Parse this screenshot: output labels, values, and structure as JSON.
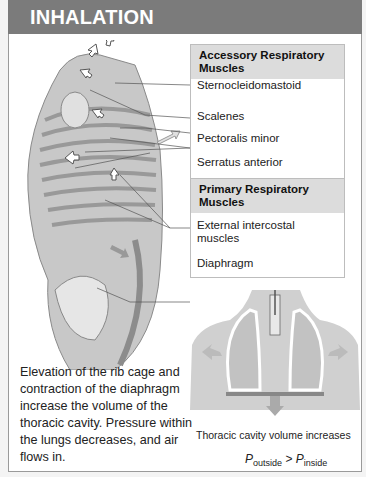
{
  "header": {
    "title": "INHALATION"
  },
  "accessory_box": {
    "title": "Accessory Respiratory Muscles",
    "items": [
      "Sternocleidomastoid",
      "Scalenes",
      "Pectoralis minor",
      "Serratus anterior"
    ]
  },
  "primary_box": {
    "title": "Primary Respiratory Muscles",
    "items": [
      "External intercostal muscles",
      "Diaphragm"
    ]
  },
  "description": "Elevation of the rib cage and contraction of the diaphragm increase the volume of the thoracic cavity. Pressure within the lungs decreases, and air flows in.",
  "caption": "Thoracic cavity volume increases",
  "equation": {
    "left": "P",
    "left_sub": "outside",
    "op": ">",
    "right": "P",
    "right_sub": "inside"
  },
  "colors": {
    "header_bg": "#7b7b7b",
    "box_header_bg": "#dcdcdc",
    "arrow": "#b9b9b9"
  }
}
